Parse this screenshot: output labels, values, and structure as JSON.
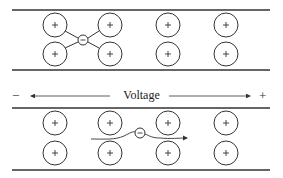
{
  "diagram": {
    "voltage_label": "Voltage",
    "negative_sign": "−",
    "positive_sign": "+",
    "ion_symbol": "+",
    "electron_symbol": "−",
    "colors": {
      "stroke": "#333333",
      "background": "#ffffff"
    },
    "top_panel": {
      "description": "Electron trapped between four positive ions (bound state)",
      "ion_columns_x": [
        55,
        110,
        168,
        226
      ],
      "ion_rows_y": [
        25,
        54
      ],
      "electron": {
        "x": 83,
        "y": 40
      }
    },
    "bottom_panel": {
      "description": "Electron drifting through lattice toward positive voltage",
      "ion_columns_x": [
        55,
        110,
        168,
        226
      ],
      "ion_rows_y": [
        123,
        153
      ],
      "electron": {
        "x": 140,
        "y": 134
      }
    }
  }
}
